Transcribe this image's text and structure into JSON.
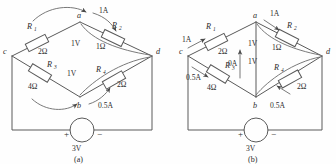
{
  "figure": {
    "title": "",
    "panels": [
      {
        "id": "a",
        "caption": "(a)",
        "nodes": {
          "a": "a",
          "b": "b",
          "c": "c",
          "d": "d"
        },
        "resistors": [
          {
            "name": "R",
            "sub": "1",
            "value": "2Ω"
          },
          {
            "name": "R",
            "sub": "2",
            "value": "1Ω"
          },
          {
            "name": "R",
            "sub": "3",
            "value": "4Ω"
          },
          {
            "name": "R",
            "sub": "4",
            "value": "2Ω"
          }
        ],
        "annotations": [
          {
            "label": "1A",
            "kind": "current"
          },
          {
            "label": "1V",
            "kind": "voltage"
          },
          {
            "label": "1V",
            "kind": "voltage"
          },
          {
            "label": "0.5A",
            "kind": "current"
          }
        ],
        "source": {
          "value": "3V",
          "plus": "+",
          "minus": "−"
        }
      },
      {
        "id": "b",
        "caption": "(b)",
        "nodes": {
          "a": "a",
          "b": "b",
          "c": "c",
          "d": "d"
        },
        "resistors": [
          {
            "name": "R",
            "sub": "1",
            "value": "2Ω"
          },
          {
            "name": "R",
            "sub": "2",
            "value": "1Ω"
          },
          {
            "name": "R",
            "sub": "3",
            "value": "4Ω"
          },
          {
            "name": "R",
            "sub": "4",
            "value": "2Ω"
          }
        ],
        "annotations": [
          {
            "label": "1A",
            "kind": "current"
          },
          {
            "label": "1A",
            "kind": "current"
          },
          {
            "label": "0.5A",
            "kind": "current"
          },
          {
            "label": "0.5A",
            "kind": "current"
          },
          {
            "label": "0A",
            "kind": "current"
          },
          {
            "label": "1V",
            "kind": "voltage"
          },
          {
            "label": "1V",
            "kind": "voltage"
          }
        ],
        "source": {
          "value": "3V",
          "plus": "+",
          "minus": "−"
        }
      }
    ]
  },
  "colors": {
    "wire": "#5a5a5a",
    "text": "#2b2b2b",
    "background": "#fefefe"
  }
}
